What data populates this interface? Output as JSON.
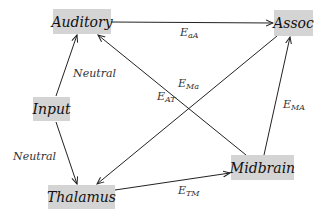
{
  "nodes": {
    "auditory": {
      "label": "Auditory"
    },
    "assoc": {
      "label": "Assoc"
    },
    "input": {
      "label": "Input"
    },
    "thalamus": {
      "label": "Thalamus"
    },
    "midbrain": {
      "label": "Midbrain"
    }
  },
  "edges": [
    {
      "from": "Auditory",
      "to": "Assoc",
      "label_main": "E",
      "label_sub": "aA"
    },
    {
      "from": "Input",
      "to": "Auditory",
      "label_main": "Neutral",
      "label_sub": ""
    },
    {
      "from": "Input",
      "to": "Thalamus",
      "label_main": "Neutral",
      "label_sub": ""
    },
    {
      "from": "Midbrain",
      "to": "Auditory",
      "label_main": "E",
      "label_sub": "AT"
    },
    {
      "from": "Assoc",
      "to": "Thalamus",
      "label_main": "E",
      "label_sub": "Ma"
    },
    {
      "from": "Midbrain",
      "to": "Assoc",
      "label_main": "E",
      "label_sub": "MA"
    },
    {
      "from": "Thalamus",
      "to": "Midbrain",
      "label_main": "E",
      "label_sub": "TM"
    }
  ],
  "colors": {
    "node_fill": "#d4d4d4",
    "edge": "#222222"
  }
}
